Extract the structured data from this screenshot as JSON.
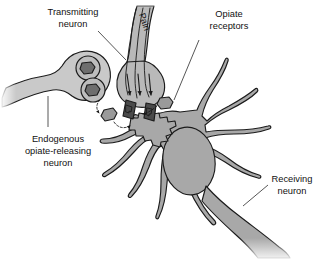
{
  "figure": {
    "background_color": "#ffffff",
    "width": 329,
    "height": 262
  },
  "labels": {
    "transmitting_neuron": {
      "line1": "Transmitting",
      "line2": "neuron"
    },
    "pain": {
      "text": "Pain"
    },
    "opiate_receptors": {
      "line1": "Opiate",
      "line2": "receptors"
    },
    "endogenous_neuron": {
      "line1": "Endogenous",
      "line2": "opiate-releasing",
      "line3": "neuron"
    },
    "receiving_neuron": {
      "line1": "Receiving",
      "line2": "neuron"
    }
  },
  "colors": {
    "outline": "#1b1b1b",
    "text": "#111111",
    "receiving_neuron_fill": "#a8a8a8",
    "receiving_nucleus_fill": "#a8a8a8",
    "transmitting_neuron_fill": "#b9b9b9",
    "endogenous_neuron_fill": "#c9c9c9",
    "vesicle_fill": "#bdbdbd",
    "opiate_molecule_fill": "#6e6e6e",
    "transmitter_dark_fill": "#4a4a4a",
    "receptor_fill": "#9a9a9a",
    "background": "#ffffff"
  },
  "structures": {
    "transmitting_neuron_name": "transmitting-neuron",
    "endogenous_neuron_name": "endogenous-opiate-releasing-neuron",
    "receiving_neuron_name": "receiving-neuron",
    "vesicle_count": 2,
    "opiate_molecule_count": 2,
    "neurotransmitter_count": 2,
    "receptor_count": 3,
    "signal_arrow_count": 3
  }
}
